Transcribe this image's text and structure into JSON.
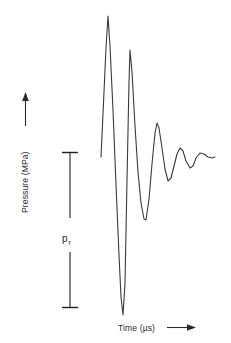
{
  "figure": {
    "background_color": "#ffffff",
    "width": 231,
    "height": 343
  },
  "axes": {
    "y": {
      "label": "Pressure (MPa)",
      "arrow_direction": "up",
      "arrow_name": "y-axis-arrow"
    },
    "x": {
      "label": "Time (µs)",
      "arrow_direction": "right",
      "arrow_name": "x-axis-arrow"
    }
  },
  "scale_bar": {
    "name": "pressure-scale-bar",
    "label_base": "p",
    "label_subscript": "r",
    "label_full": "p_r",
    "style": "i-beam",
    "color": "#1f1f1f"
  },
  "chart_data": {
    "type": "line",
    "title": "",
    "xlabel": "Time (µs)",
    "ylabel": "Pressure (MPa)",
    "grid": false,
    "legend": "none",
    "axis_ticks": "none",
    "annotations": [
      {
        "name": "pressure-scale-bar",
        "text": "p_r",
        "kind": "scale-bar",
        "meaning": "peak rarefactional pressure amplitude reference span"
      }
    ],
    "series": [
      {
        "name": "acoustic-pressure-waveform",
        "color": "#3a3a3a",
        "linewidth": 1.1,
        "description": "Damped oscillatory ultrasound pressure pulse: large compressional peak, very large rarefactional trough, then decaying ringdown toward baseline.",
        "points": [
          {
            "x": 101,
            "y": 157
          },
          {
            "x": 104,
            "y": 92
          },
          {
            "x": 106,
            "y": 48
          },
          {
            "x": 108,
            "y": 16
          },
          {
            "x": 110,
            "y": 46
          },
          {
            "x": 113,
            "y": 110
          },
          {
            "x": 116,
            "y": 185
          },
          {
            "x": 119,
            "y": 255
          },
          {
            "x": 121,
            "y": 297
          },
          {
            "x": 123,
            "y": 315
          },
          {
            "x": 125,
            "y": 283
          },
          {
            "x": 127,
            "y": 180
          },
          {
            "x": 129,
            "y": 82
          },
          {
            "x": 130,
            "y": 50
          },
          {
            "x": 132,
            "y": 72
          },
          {
            "x": 135,
            "y": 126
          },
          {
            "x": 138,
            "y": 172
          },
          {
            "x": 141,
            "y": 203
          },
          {
            "x": 144,
            "y": 219
          },
          {
            "x": 146,
            "y": 220
          },
          {
            "x": 149,
            "y": 199
          },
          {
            "x": 152,
            "y": 164
          },
          {
            "x": 155,
            "y": 133
          },
          {
            "x": 157,
            "y": 123
          },
          {
            "x": 159,
            "y": 128
          },
          {
            "x": 162,
            "y": 148
          },
          {
            "x": 165,
            "y": 169
          },
          {
            "x": 168,
            "y": 181
          },
          {
            "x": 171,
            "y": 178
          },
          {
            "x": 174,
            "y": 166
          },
          {
            "x": 177,
            "y": 154
          },
          {
            "x": 180,
            "y": 148
          },
          {
            "x": 183,
            "y": 151
          },
          {
            "x": 186,
            "y": 161
          },
          {
            "x": 190,
            "y": 168
          },
          {
            "x": 193,
            "y": 166
          },
          {
            "x": 196,
            "y": 158
          },
          {
            "x": 200,
            "y": 153
          },
          {
            "x": 204,
            "y": 154
          },
          {
            "x": 208,
            "y": 157
          },
          {
            "x": 212,
            "y": 158
          },
          {
            "x": 215,
            "y": 157
          }
        ]
      }
    ],
    "xlim": [
      95,
      225
    ],
    "ylim_pixels": [
      10,
      325
    ]
  }
}
